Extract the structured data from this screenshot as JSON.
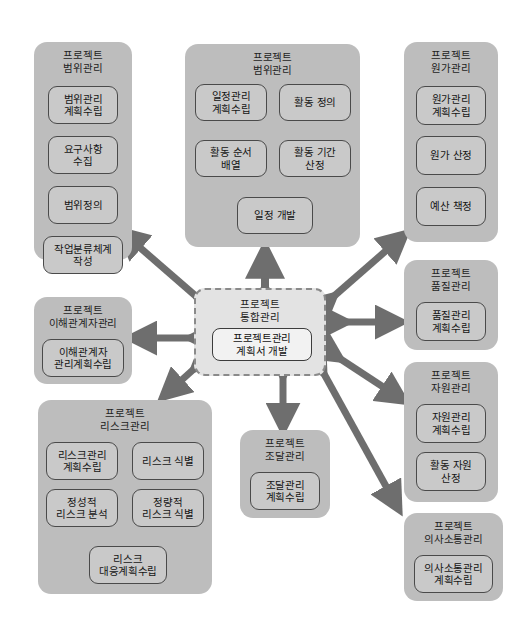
{
  "diagram": {
    "colors": {
      "group_fill": "#bdbdbd",
      "node_fill": "#c9c9c9",
      "node_border": "#4a4a4a",
      "center_fill": "#e3e3e3",
      "center_border": "#8a8a8a",
      "arrow": "#6e6e6e",
      "inner_arrow": "#3c3c3c",
      "background": "#ffffff"
    }
  },
  "center": {
    "title": "프로젝트\n통합관리",
    "node": "프로젝트관리\n계획서 개발"
  },
  "groups": [
    {
      "id": "scope",
      "title": "프로젝트\n범위관리",
      "nodes": [
        {
          "label": "범위관리\n계획수립"
        },
        {
          "label": "요구사항\n수집"
        },
        {
          "label": "범위정의"
        },
        {
          "label": "작업분류체계\n작성"
        }
      ]
    },
    {
      "id": "schedule",
      "title": "프로젝트\n범위관리",
      "nodes": [
        {
          "label": "일정관리\n계획수립"
        },
        {
          "label": "활동 정의"
        },
        {
          "label": "활동 순서\n배열"
        },
        {
          "label": "활동 기간\n산정"
        },
        {
          "label": "일정 개발"
        }
      ]
    },
    {
      "id": "cost",
      "title": "프로젝트\n원가관리",
      "nodes": [
        {
          "label": "원가관리\n계획수립"
        },
        {
          "label": "원가 산정"
        },
        {
          "label": "예산 책정"
        }
      ]
    },
    {
      "id": "quality",
      "title": "프로젝트\n품질관리",
      "nodes": [
        {
          "label": "품질관리\n계획수립"
        }
      ]
    },
    {
      "id": "resource",
      "title": "프로젝트\n자원관리",
      "nodes": [
        {
          "label": "자원관리\n계획수립"
        },
        {
          "label": "활동 자원\n산정"
        }
      ]
    },
    {
      "id": "communication",
      "title": "프로젝트\n의사소통관리",
      "nodes": [
        {
          "label": "의사소통관리\n계획수립"
        }
      ]
    },
    {
      "id": "stakeholder",
      "title": "프로젝트\n이해관계자관리",
      "nodes": [
        {
          "label": "이해관계자\n관리계획수립"
        }
      ]
    },
    {
      "id": "risk",
      "title": "프로젝트\n리스크관리",
      "nodes": [
        {
          "label": "리스크관리\n계획수립"
        },
        {
          "label": "리스크 식별"
        },
        {
          "label": "정성적\n리스크 분석"
        },
        {
          "label": "정량적\n리스크 식별"
        },
        {
          "label": "리스크\n대응계획수립"
        }
      ]
    },
    {
      "id": "procurement",
      "title": "프로젝트\n조달관리",
      "nodes": [
        {
          "label": "조달관리\n계획수립"
        }
      ]
    }
  ],
  "connections": [
    {
      "from": "center",
      "to": "scope",
      "style": "double-arrow"
    },
    {
      "from": "center",
      "to": "schedule",
      "style": "double-arrow"
    },
    {
      "from": "center",
      "to": "cost",
      "style": "double-arrow"
    },
    {
      "from": "center",
      "to": "quality",
      "style": "double-arrow"
    },
    {
      "from": "center",
      "to": "resource",
      "style": "double-arrow"
    },
    {
      "from": "center",
      "to": "communication",
      "style": "double-arrow"
    },
    {
      "from": "center",
      "to": "stakeholder",
      "style": "double-arrow"
    },
    {
      "from": "center",
      "to": "risk",
      "style": "double-arrow"
    },
    {
      "from": "center",
      "to": "procurement",
      "style": "double-arrow"
    }
  ]
}
